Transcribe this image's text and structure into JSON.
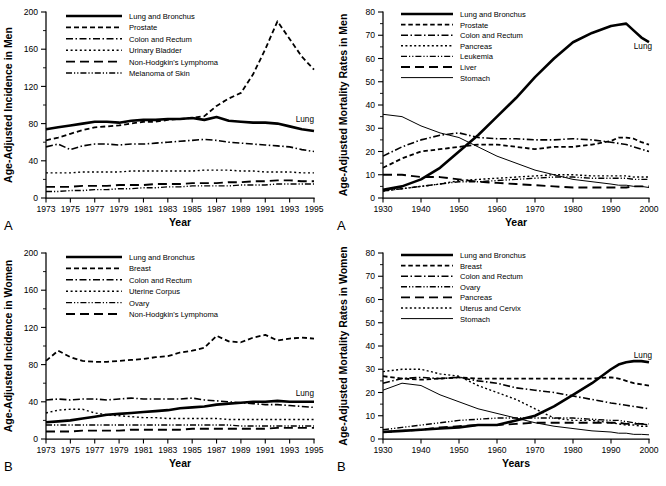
{
  "figure": {
    "panels": [
      {
        "id": "panel-a-incidence-men",
        "letter": "A",
        "ylabel": "Age-Adjusted Incidence in Men",
        "xlabel": "Year",
        "annotation": "Lung",
        "legend": [
          {
            "label": "Lung and Bronchus",
            "dash": "none",
            "width": 2.6
          },
          {
            "label": "Prostate",
            "dash": "5,3",
            "width": 1.8
          },
          {
            "label": "Colon and Rectum",
            "dash": "7,2.5,1.5,2.5",
            "width": 1.6
          },
          {
            "label": "Urinary Bladder",
            "dash": "2,2.6",
            "width": 1.4
          },
          {
            "label": "Non-Hodgkin's Lymphoma",
            "dash": "9,5",
            "width": 1.9
          },
          {
            "label": "Melanoma of Skin",
            "dash": "6,2,1.2,2,1.2,2",
            "width": 1.4
          }
        ]
      },
      {
        "id": "panel-a-mortality-men",
        "letter": "A",
        "ylabel": "Age-Adjusted Mortality Rates in Men",
        "xlabel": "Year",
        "annotation": "Lung",
        "legend": [
          {
            "label": "Lung and Bronchus",
            "dash": "none",
            "width": 2.6
          },
          {
            "label": "Prostate",
            "dash": "4.5,2.8",
            "width": 1.8
          },
          {
            "label": "Colon and Rectum",
            "dash": "7,2.5,1.5,2.5",
            "width": 1.6
          },
          {
            "label": "Pancreas",
            "dash": "2,2.4",
            "width": 1.4
          },
          {
            "label": "Leukemia",
            "dash": "6,2,1.2,2,1.2,2",
            "width": 1.4
          },
          {
            "label": "Liver",
            "dash": "9,5",
            "width": 1.9
          },
          {
            "label": "Stomach",
            "dash": "none",
            "width": 1.0
          }
        ]
      },
      {
        "id": "panel-b-incidence-women",
        "letter": "B",
        "ylabel": "Age-Adjusted Incidence in Women",
        "xlabel": "Year",
        "annotation": "Lung",
        "legend": [
          {
            "label": "Lung and Bronchus",
            "dash": "none",
            "width": 2.6
          },
          {
            "label": "Breast",
            "dash": "5,3",
            "width": 1.8
          },
          {
            "label": "Colon and Rectum",
            "dash": "7,2.5,1.5,2.5",
            "width": 1.6
          },
          {
            "label": "Uterine Corpus",
            "dash": "2,2.6",
            "width": 1.4
          },
          {
            "label": "Ovary",
            "dash": "6,2,1.2,2,1.2,2",
            "width": 1.4
          },
          {
            "label": "Non-Hodgkin's Lymphoma",
            "dash": "9,5",
            "width": 1.9
          }
        ]
      },
      {
        "id": "panel-b-mortality-women",
        "letter": "B",
        "ylabel": "Age-Adjusted Mortality Rates in Women",
        "xlabel": "Years",
        "annotation": "Lung",
        "legend": [
          {
            "label": "Lung and Bronchus",
            "dash": "none",
            "width": 2.6
          },
          {
            "label": "Breast",
            "dash": "4.5,2.8",
            "width": 1.8
          },
          {
            "label": "Colon and Rectum",
            "dash": "7,2.5,1.5,2.5",
            "width": 1.6
          },
          {
            "label": "Ovary",
            "dash": "6,2,1.2,2,1.2,2",
            "width": 1.4
          },
          {
            "label": "Pancreas",
            "dash": "9,5",
            "width": 1.9
          },
          {
            "label": "Uterus and Cervix",
            "dash": "2,2.4",
            "width": 1.4
          },
          {
            "label": "Stomach",
            "dash": "none",
            "width": 1.0
          }
        ]
      }
    ]
  },
  "chart_data": [
    {
      "type": "line",
      "id": "incidence-men",
      "panel_letter": "A",
      "title": "",
      "xlabel": "Year",
      "ylabel": "Age-Adjusted Incidence in Men",
      "xlim": [
        1973,
        1995
      ],
      "ylim": [
        0,
        200
      ],
      "yticks": [
        0,
        40,
        80,
        120,
        160,
        200
      ],
      "xticks": [
        1973,
        1975,
        1977,
        1979,
        1981,
        1983,
        1985,
        1987,
        1989,
        1991,
        1993,
        1995
      ],
      "grid": false,
      "legend_position": "upper-left",
      "annotations": [
        {
          "text": "Lung",
          "x": 1993.5,
          "y": 82
        }
      ],
      "x": [
        1973,
        1974,
        1975,
        1976,
        1977,
        1978,
        1979,
        1980,
        1981,
        1982,
        1983,
        1984,
        1985,
        1986,
        1987,
        1988,
        1989,
        1990,
        1991,
        1992,
        1993,
        1994,
        1995
      ],
      "series": [
        {
          "name": "Lung and Bronchus",
          "values": [
            74,
            76,
            78,
            80,
            82,
            82,
            81,
            83,
            84,
            84,
            85,
            85,
            86,
            84,
            87,
            83,
            82,
            81,
            81,
            80,
            77,
            74,
            72
          ]
        },
        {
          "name": "Prostate",
          "values": [
            62,
            65,
            69,
            73,
            76,
            77,
            78,
            80,
            82,
            82,
            84,
            85,
            86,
            88,
            99,
            107,
            113,
            133,
            160,
            190,
            171,
            152,
            138
          ]
        },
        {
          "name": "Colon and Rectum",
          "values": [
            55,
            58,
            52,
            56,
            58,
            58,
            57,
            58,
            58,
            59,
            60,
            61,
            62,
            63,
            62,
            60,
            59,
            58,
            57,
            56,
            55,
            52,
            50
          ]
        },
        {
          "name": "Urinary Bladder",
          "values": [
            27,
            27,
            27,
            28,
            28,
            28,
            28,
            29,
            29,
            29,
            29,
            29,
            29,
            30,
            30,
            30,
            29,
            29,
            28,
            28,
            28,
            27,
            27
          ]
        },
        {
          "name": "Non-Hodgkin's Lymphoma",
          "values": [
            12,
            12,
            12,
            13,
            13,
            13,
            14,
            14,
            14,
            15,
            15,
            15,
            16,
            16,
            16,
            17,
            17,
            18,
            18,
            19,
            19,
            18,
            18
          ]
        },
        {
          "name": "Melanoma of Skin",
          "values": [
            7,
            7,
            8,
            8,
            9,
            9,
            10,
            10,
            11,
            11,
            12,
            12,
            13,
            13,
            13,
            13,
            14,
            14,
            14,
            15,
            15,
            15,
            15
          ]
        }
      ]
    },
    {
      "type": "line",
      "id": "mortality-men",
      "panel_letter": "A",
      "title": "",
      "xlabel": "Year",
      "ylabel": "Age-Adjusted Mortality Rates in Men",
      "xlim": [
        1930,
        2000
      ],
      "ylim": [
        0,
        80
      ],
      "yticks": [
        0,
        10,
        20,
        30,
        40,
        50,
        60,
        70,
        80
      ],
      "xticks": [
        1930,
        1940,
        1950,
        1960,
        1970,
        1980,
        1990,
        2000
      ],
      "grid": false,
      "legend_position": "upper-left",
      "annotations": [
        {
          "text": "Lung",
          "x": 1996,
          "y": 64
        }
      ],
      "x": [
        1930,
        1935,
        1940,
        1945,
        1950,
        1955,
        1960,
        1965,
        1970,
        1975,
        1980,
        1985,
        1990,
        1992,
        1994,
        1996,
        1998,
        2000
      ],
      "series": [
        {
          "name": "Lung and Bronchus",
          "values": [
            3.5,
            5,
            8,
            13,
            20,
            27,
            35,
            43,
            52,
            60,
            67,
            71,
            74,
            74.5,
            75,
            72,
            69,
            67
          ]
        },
        {
          "name": "Prostate",
          "values": [
            13,
            17,
            20,
            21,
            22,
            23,
            23,
            22,
            21,
            22,
            22,
            23,
            24.5,
            26,
            26,
            25.5,
            24,
            23
          ]
        },
        {
          "name": "Colon and Rectum",
          "values": [
            18,
            22,
            25,
            27,
            28,
            26,
            25.5,
            25.5,
            25,
            25,
            25.5,
            25,
            24,
            23.5,
            23,
            22,
            21,
            20
          ]
        },
        {
          "name": "Pancreas",
          "values": [
            3,
            4,
            5,
            6,
            7.5,
            8,
            8.5,
            9,
            9.5,
            10,
            10,
            9.5,
            9.5,
            9.5,
            9.5,
            9,
            9,
            9
          ]
        },
        {
          "name": "Leukemia",
          "values": [
            3,
            4,
            5,
            6,
            7,
            7,
            7.5,
            8,
            8.5,
            9,
            9,
            8.5,
            8.5,
            8.5,
            8.5,
            8,
            8,
            8
          ]
        },
        {
          "name": "Liver",
          "values": [
            10,
            10,
            9,
            9,
            8,
            7,
            6.5,
            6,
            5.5,
            5,
            4.5,
            4.5,
            4.5,
            4.5,
            4.5,
            5,
            5,
            5
          ]
        },
        {
          "name": "Stomach",
          "values": [
            36,
            35,
            31,
            28,
            26,
            22,
            18,
            15,
            12,
            10,
            8,
            7,
            6,
            5.5,
            5.5,
            5,
            5,
            4.5
          ]
        }
      ]
    },
    {
      "type": "line",
      "id": "incidence-women",
      "panel_letter": "B",
      "title": "",
      "xlabel": "Year",
      "ylabel": "Age-Adjusted Incidence in Women",
      "xlim": [
        1973,
        1995
      ],
      "ylim": [
        0,
        200
      ],
      "yticks": [
        0,
        40,
        80,
        120,
        160,
        200
      ],
      "xticks": [
        1973,
        1975,
        1977,
        1979,
        1981,
        1983,
        1985,
        1987,
        1989,
        1991,
        1993,
        1995
      ],
      "grid": false,
      "legend_position": "upper-left",
      "annotations": [
        {
          "text": "Lung",
          "x": 1993.5,
          "y": 46
        }
      ],
      "x": [
        1973,
        1974,
        1975,
        1976,
        1977,
        1978,
        1979,
        1980,
        1981,
        1982,
        1983,
        1984,
        1985,
        1986,
        1987,
        1988,
        1989,
        1990,
        1991,
        1992,
        1993,
        1994,
        1995
      ],
      "series": [
        {
          "name": "Lung and Bronchus",
          "values": [
            18,
            19,
            20,
            22,
            24,
            26,
            27,
            28,
            29,
            30,
            31,
            33,
            34,
            35,
            37,
            38,
            39,
            40,
            40,
            41,
            40,
            40,
            40
          ]
        },
        {
          "name": "Breast",
          "values": [
            84,
            95,
            88,
            84,
            83,
            83,
            84,
            85,
            86,
            88,
            89,
            93,
            95,
            98,
            111,
            105,
            104,
            109,
            112,
            106,
            108,
            109,
            108
          ]
        },
        {
          "name": "Colon and Rectum",
          "values": [
            42,
            43,
            42,
            43,
            43,
            42,
            43,
            44,
            43,
            43,
            43,
            43,
            44,
            42,
            41,
            40,
            39,
            38,
            37,
            37,
            36,
            35,
            34
          ]
        },
        {
          "name": "Uterine Corpus",
          "values": [
            28,
            31,
            32,
            32,
            28,
            26,
            25,
            24,
            23,
            23,
            22,
            22,
            22,
            22,
            22,
            21,
            21,
            21,
            21,
            21,
            21,
            21,
            21
          ]
        },
        {
          "name": "Ovary",
          "values": [
            15,
            15,
            15,
            15,
            15,
            15,
            15,
            15,
            15,
            15,
            15,
            15,
            15,
            15,
            15,
            15,
            14,
            14,
            14,
            14,
            14,
            14,
            14
          ]
        },
        {
          "name": "Non-Hodgkin's Lymphoma",
          "values": [
            8,
            8,
            8,
            9,
            9,
            9,
            9,
            10,
            10,
            10,
            10,
            10,
            11,
            11,
            11,
            11,
            11,
            11,
            11,
            12,
            12,
            12,
            12
          ]
        }
      ]
    },
    {
      "type": "line",
      "id": "mortality-women",
      "panel_letter": "B",
      "title": "",
      "xlabel": "Years",
      "ylabel": "Age-Adjusted Mortality Rates in Women",
      "xlim": [
        1930,
        2000
      ],
      "ylim": [
        0,
        80
      ],
      "yticks": [
        0,
        10,
        20,
        30,
        40,
        50,
        60,
        70,
        80
      ],
      "xticks": [
        1930,
        1940,
        1950,
        1960,
        1970,
        1980,
        1990,
        2000
      ],
      "grid": false,
      "legend_position": "upper-left",
      "annotations": [
        {
          "text": "Lung",
          "x": 1996,
          "y": 35
        }
      ],
      "x": [
        1930,
        1935,
        1940,
        1945,
        1950,
        1955,
        1960,
        1965,
        1970,
        1975,
        1980,
        1985,
        1990,
        1992,
        1994,
        1996,
        1998,
        2000
      ],
      "series": [
        {
          "name": "Lung and Bronchus",
          "values": [
            3,
            3.5,
            4,
            4.5,
            5,
            6,
            6,
            8,
            10,
            14,
            19,
            24,
            30,
            32,
            33,
            33.5,
            33.5,
            33
          ]
        },
        {
          "name": "Breast",
          "values": [
            27,
            26,
            25.5,
            26,
            26.5,
            26,
            26,
            26,
            26,
            26,
            26,
            26,
            26.5,
            26,
            25,
            24,
            23.5,
            23
          ]
        },
        {
          "name": "Colon and Rectum",
          "values": [
            24,
            26,
            26.5,
            26,
            26.5,
            25,
            24,
            22,
            21,
            20,
            18.5,
            17,
            15.5,
            15,
            14.5,
            14,
            13.5,
            13
          ]
        },
        {
          "name": "Ovary",
          "values": [
            4,
            5,
            6,
            7,
            8,
            8.5,
            9,
            9,
            9,
            9,
            9,
            8.5,
            8,
            8,
            7.5,
            7,
            6.5,
            6
          ]
        },
        {
          "name": "Pancreas",
          "values": [
            3,
            3.5,
            4,
            5,
            5.5,
            6,
            6,
            6.5,
            7,
            7,
            7,
            7,
            7,
            7,
            6.5,
            6.5,
            6.5,
            6.5
          ]
        },
        {
          "name": "Uterus and Cervix",
          "values": [
            29,
            30,
            30,
            28,
            27,
            23,
            20,
            17,
            13,
            9,
            8,
            8,
            7,
            6.5,
            6,
            6,
            5.5,
            5.5
          ]
        },
        {
          "name": "Stomach",
          "values": [
            21,
            24,
            23,
            19,
            16,
            13,
            11,
            9,
            7,
            5.5,
            4.5,
            3.5,
            3,
            2.5,
            2.5,
            2,
            2,
            1.8
          ]
        }
      ]
    }
  ]
}
